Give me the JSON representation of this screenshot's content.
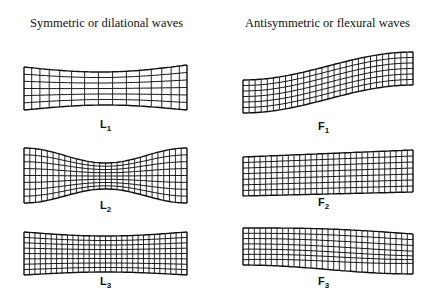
{
  "columns": [
    {
      "title": "Symmetric or dilational waves",
      "modes": [
        {
          "letter": "L",
          "index": "1"
        },
        {
          "letter": "L",
          "index": "2"
        },
        {
          "letter": "L",
          "index": "3"
        }
      ]
    },
    {
      "title": "Antisymmetric or flexural waves",
      "modes": [
        {
          "letter": "F",
          "index": "1"
        },
        {
          "letter": "F",
          "index": "2"
        },
        {
          "letter": "F",
          "index": "3"
        }
      ]
    }
  ]
}
